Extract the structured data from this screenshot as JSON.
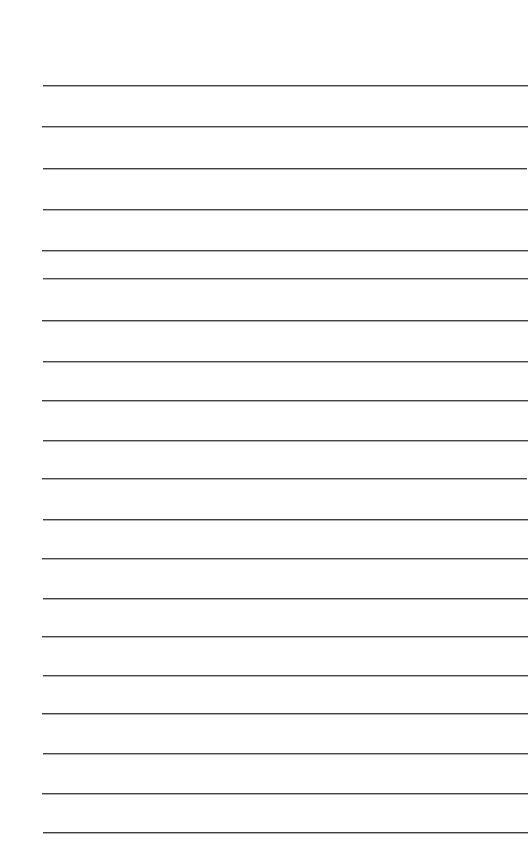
{
  "document": {
    "kind": "lined-notepad-page",
    "title": "Blank ruled notepad page",
    "page_width": 532,
    "page_height": 863,
    "background_color": "#ffffff",
    "has_text_content": false,
    "body_text": ""
  },
  "ruling": {
    "line_count": 19,
    "line_color": "#33353b",
    "line_thickness_px": 1,
    "left_margin_px": 42,
    "right_margin_px": 528,
    "first_line_y_px": 85,
    "last_line_y_px": 832,
    "line_spacing_px": 41.5,
    "lines": [
      {
        "index": 1,
        "y": 85,
        "x1": 43,
        "x2": 528,
        "color": "#33353b",
        "opacity": 0.92
      },
      {
        "index": 2,
        "y": 126,
        "x1": 42,
        "x2": 528,
        "color": "#33353b",
        "opacity": 0.9
      },
      {
        "index": 3,
        "y": 168,
        "x1": 43,
        "x2": 527,
        "color": "#33353b",
        "opacity": 0.95
      },
      {
        "index": 4,
        "y": 209,
        "x1": 43,
        "x2": 528,
        "color": "#33353b",
        "opacity": 0.9
      },
      {
        "index": 5,
        "y": 250,
        "x1": 42,
        "x2": 528,
        "color": "#33353b",
        "opacity": 0.93
      },
      {
        "index": 6,
        "y": 278,
        "x1": 43,
        "x2": 528,
        "color": "#33353b",
        "opacity": 0.88
      },
      {
        "index": 7,
        "y": 320,
        "x1": 42,
        "x2": 528,
        "color": "#33353b",
        "opacity": 0.94
      },
      {
        "index": 8,
        "y": 361,
        "x1": 43,
        "x2": 528,
        "color": "#33353b",
        "opacity": 0.9
      },
      {
        "index": 9,
        "y": 400,
        "x1": 42,
        "x2": 528,
        "color": "#33353b",
        "opacity": 0.93
      },
      {
        "index": 10,
        "y": 440,
        "x1": 43,
        "x2": 528,
        "color": "#33353b",
        "opacity": 0.92
      },
      {
        "index": 11,
        "y": 478,
        "x1": 42,
        "x2": 527,
        "color": "#33353b",
        "opacity": 0.9
      },
      {
        "index": 12,
        "y": 519,
        "x1": 43,
        "x2": 528,
        "color": "#33353b",
        "opacity": 0.94
      },
      {
        "index": 13,
        "y": 558,
        "x1": 42,
        "x2": 528,
        "color": "#33353b",
        "opacity": 0.89
      },
      {
        "index": 14,
        "y": 598,
        "x1": 43,
        "x2": 528,
        "color": "#33353b",
        "opacity": 0.93
      },
      {
        "index": 15,
        "y": 636,
        "x1": 42,
        "x2": 528,
        "color": "#33353b",
        "opacity": 0.92
      },
      {
        "index": 16,
        "y": 675,
        "x1": 43,
        "x2": 528,
        "color": "#33353b",
        "opacity": 0.9
      },
      {
        "index": 17,
        "y": 713,
        "x1": 42,
        "x2": 528,
        "color": "#33353b",
        "opacity": 0.94
      },
      {
        "index": 18,
        "y": 753,
        "x1": 43,
        "x2": 528,
        "color": "#33353b",
        "opacity": 0.91
      },
      {
        "index": 19,
        "y": 793,
        "x1": 42,
        "x2": 528,
        "color": "#33353b",
        "opacity": 0.93
      },
      {
        "index": 20,
        "y": 832,
        "x1": 43,
        "x2": 528,
        "color": "#33353b",
        "opacity": 0.95
      }
    ]
  }
}
